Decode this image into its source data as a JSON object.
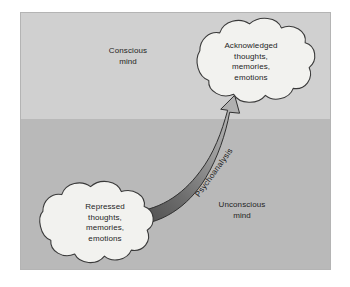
{
  "diagram": {
    "type": "concept-diagram",
    "zones": [
      {
        "id": "conscious",
        "label": "Conscious\nmind",
        "color": "#d0d0d0",
        "position": "top"
      },
      {
        "id": "unconscious",
        "label": "Unconscious\nmind",
        "color": "#b9b9b9",
        "position": "bottom"
      }
    ],
    "nodes": [
      {
        "id": "acknowledged",
        "shape": "cloud",
        "zone": "conscious",
        "text": "Acknowledged\nthoughts,\nmemories,\nemotions",
        "fill": "#f2f2ef",
        "stroke": "#3a3a3a"
      },
      {
        "id": "repressed",
        "shape": "cloud",
        "zone": "unconscious",
        "text": "Repressed\nthoughts,\nmemories,\nemotions",
        "fill": "#f2f2ef",
        "stroke": "#3a3a3a"
      }
    ],
    "connector": {
      "id": "psychoanalysis-arrow",
      "label": "Psychoanalysis",
      "from": "repressed",
      "to": "acknowledged",
      "style": "curved-tapered-arrow",
      "fill_dark": "#5a5a5a",
      "fill_light": "#a8a8a8",
      "stroke": "#2e2e2e"
    },
    "panel": {
      "border_color": "#b4b4b4",
      "background_top": "#d0d0d0",
      "background_bottom": "#b9b9b9"
    },
    "colors": {
      "text": "#242424",
      "cloud_fill": "#f2f2ef",
      "cloud_stroke": "#3a3a3a",
      "page_background": "#ffffff"
    }
  }
}
